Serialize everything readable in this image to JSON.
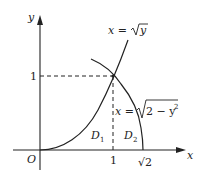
{
  "diagram": {
    "type": "function-region-plot",
    "axes": {
      "x_label": "x",
      "y_label": "y",
      "origin_label": "O",
      "x_ticks": [
        "1",
        "√2"
      ],
      "y_ticks": [
        "1"
      ]
    },
    "curves": [
      {
        "name": "parabola",
        "equation_lhs": "x = ",
        "equation_rhs": "y",
        "label": "x = √y"
      },
      {
        "name": "circle-arc",
        "equation_lhs": "x = ",
        "equation_rhs": "2 − y",
        "label": "x = √(2 − y²)"
      }
    ],
    "regions": [
      {
        "name": "D1",
        "base": "D",
        "sub": "1"
      },
      {
        "name": "D2",
        "base": "D",
        "sub": "2"
      }
    ],
    "intersection": {
      "x": 1,
      "y": 1
    },
    "colors": {
      "stroke": "#222222",
      "background": "#ffffff"
    }
  }
}
